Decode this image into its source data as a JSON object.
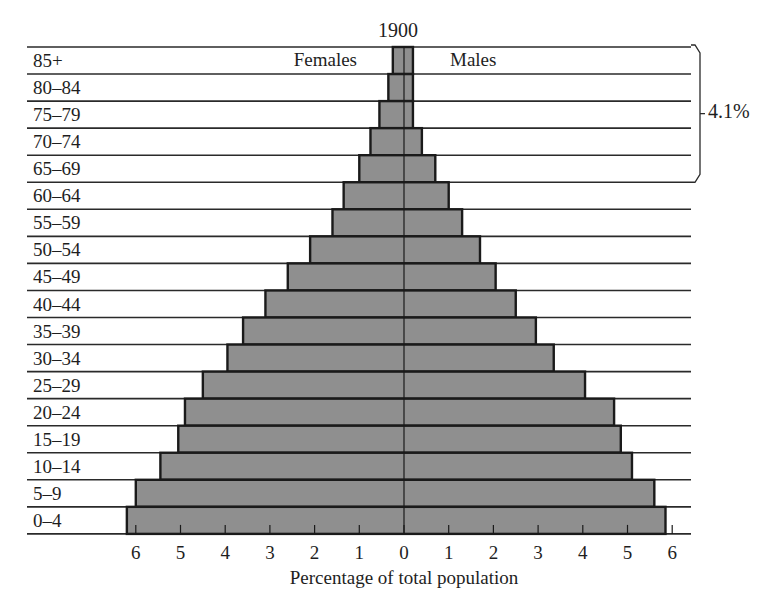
{
  "chart_data": {
    "type": "bar",
    "subtype": "population-pyramid",
    "title": "1900",
    "xlabel": "Percentage of total population",
    "ylabel": "",
    "left_series_label": "Females",
    "right_series_label": "Males",
    "xlim": [
      -6,
      6
    ],
    "xticks_left": [
      "6",
      "5",
      "4",
      "3",
      "2",
      "1"
    ],
    "xtick_zero": "0",
    "xticks_right": [
      "1",
      "2",
      "3",
      "4",
      "5",
      "6"
    ],
    "grid": "horizontal row separators",
    "categories": [
      "85+",
      "80-84",
      "75-79",
      "70-74",
      "65-69",
      "60-64",
      "55-59",
      "50-54",
      "45-49",
      "40-44",
      "35-39",
      "30-34",
      "25-29",
      "20-24",
      "15-19",
      "10-14",
      "5-9",
      "0-4"
    ],
    "category_labels": [
      "85+",
      "80–84",
      "75–79",
      "70–74",
      "65–69",
      "60–64",
      "55–59",
      "50–54",
      "45–49",
      "40–44",
      "35–39",
      "30–34",
      "25–29",
      "20–24",
      "15–19",
      "10–14",
      "5–9",
      "0–4"
    ],
    "series": [
      {
        "name": "Females",
        "side": "left",
        "values": [
          0.25,
          0.35,
          0.55,
          0.75,
          1.0,
          1.35,
          1.6,
          2.1,
          2.6,
          3.1,
          3.6,
          3.95,
          4.5,
          4.9,
          5.05,
          5.45,
          6.0,
          6.2
        ]
      },
      {
        "name": "Males",
        "side": "right",
        "values": [
          0.2,
          0.2,
          0.2,
          0.4,
          0.7,
          1.0,
          1.3,
          1.7,
          2.05,
          2.5,
          2.95,
          3.35,
          4.05,
          4.7,
          4.85,
          5.1,
          5.6,
          5.85
        ]
      }
    ],
    "annotation": {
      "text": "4.1%",
      "spans_categories": [
        "85+",
        "80-84",
        "75-79",
        "70-74",
        "65-69"
      ],
      "description": "bracket over ages 65+"
    },
    "colors": {
      "bar_fill": "#8f8f8f",
      "bar_stroke": "#1a1a1a",
      "line": "#2a2a2a",
      "background": "#ffffff"
    }
  }
}
